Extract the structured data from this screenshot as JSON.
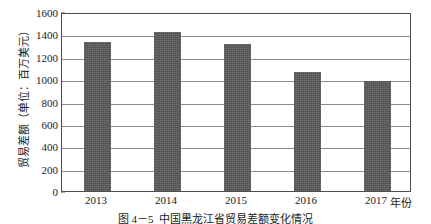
{
  "chart_data": {
    "type": "bar",
    "title": "",
    "caption": "图 4－5  中国黑龙江省贸易差额变化情况",
    "caption_number": "图 4－5",
    "caption_text": "中国黑龙江省贸易差额变化情况",
    "categories": [
      "2013",
      "2014",
      "2015",
      "2016",
      "2017"
    ],
    "values": [
      1330,
      1420,
      1310,
      1060,
      980
    ],
    "series": [
      {
        "name": "贸易差额",
        "values": [
          1330,
          1420,
          1310,
          1060,
          980
        ]
      }
    ],
    "xlabel": "年份",
    "ylabel": "贸易差额（单位：百万美元）",
    "ylim": [
      0,
      1600
    ],
    "ytick_step": 200,
    "ytick_labels": [
      "0",
      "200",
      "400",
      "600",
      "800",
      "1000",
      "1200",
      "1400",
      "1600"
    ],
    "ytick_values": [
      0,
      200,
      400,
      600,
      800,
      1000,
      1200,
      1400,
      1600
    ],
    "grid": "horizontal",
    "legend": "none",
    "bar_color": "#595959",
    "grid_color": "#8c8c8c",
    "frame_color": "#4d4d4d"
  }
}
